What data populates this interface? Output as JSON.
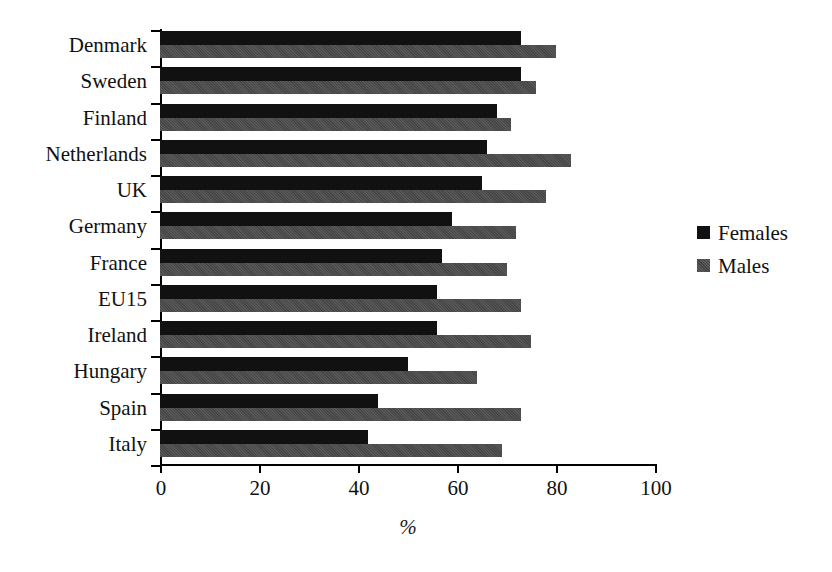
{
  "chart_data": {
    "type": "bar",
    "orientation": "horizontal",
    "title": "",
    "xlabel": "%",
    "ylabel": "",
    "xlim": [
      0,
      100
    ],
    "xticks": [
      0,
      20,
      40,
      60,
      80,
      100
    ],
    "grid": false,
    "legend_position": "right",
    "categories": [
      "Denmark",
      "Sweden",
      "Finland",
      "Netherlands",
      "UK",
      "Germany",
      "France",
      "EU15",
      "Ireland",
      "Hungary",
      "Spain",
      "Italy"
    ],
    "series": [
      {
        "name": "Females",
        "color": "#111111",
        "values": [
          73,
          73,
          68,
          66,
          65,
          59,
          57,
          56,
          56,
          50,
          44,
          42
        ]
      },
      {
        "name": "Males",
        "color": "#4b4b4b",
        "values": [
          80,
          76,
          71,
          83,
          78,
          72,
          70,
          73,
          75,
          64,
          73,
          69
        ]
      }
    ]
  },
  "axis": {
    "x_tick_labels": [
      "0",
      "20",
      "40",
      "60",
      "80",
      "100"
    ],
    "x_title": "%"
  },
  "legend": {
    "items": [
      {
        "label": "Females"
      },
      {
        "label": "Males"
      }
    ]
  }
}
